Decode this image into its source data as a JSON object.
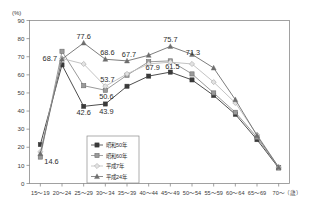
{
  "chart_data": {
    "type": "line",
    "title": "",
    "xlabel": "",
    "ylabel": "(%)",
    "x_unit": "（歳）",
    "ylim": [
      0,
      90
    ],
    "ytick_step": 10,
    "grid": false,
    "legend_position": "inside-bottom-center",
    "categories": [
      "15～19",
      "20～24",
      "25～29",
      "30～34",
      "35～39",
      "40～44",
      "45～49",
      "50～54",
      "55～59",
      "60～64",
      "65～69",
      "70～"
    ],
    "yticks": [
      "0",
      "10",
      "20",
      "30",
      "40",
      "50",
      "60",
      "70",
      "80",
      "90"
    ],
    "series": [
      {
        "name": "昭和50年",
        "marker": "filled-square",
        "color": "#3a3a3a",
        "values": [
          21.5,
          65.5,
          42.6,
          43.9,
          53.7,
          59.3,
          61.5,
          57.2,
          48.6,
          38.2,
          24.2,
          8.6
        ]
      },
      {
        "name": "昭和60年",
        "marker": "shaded-square",
        "color": "#8d8d8d",
        "values": [
          14.6,
          73.0,
          54.0,
          51.5,
          59.8,
          67.2,
          67.7,
          60.5,
          50.0,
          39.3,
          25.5,
          8.7
        ]
      },
      {
        "name": "平成7年",
        "marker": "light-diamond",
        "color": "#bcbcbc",
        "values": [
          17.5,
          69.0,
          66.0,
          53.7,
          60.5,
          66.0,
          67.0,
          66.0,
          56.0,
          44.5,
          27.0,
          9.0
        ]
      },
      {
        "name": "平成24年",
        "marker": "triangle",
        "color": "#6e6e6e",
        "values": [
          16.5,
          68.7,
          77.6,
          68.6,
          67.7,
          70.8,
          75.7,
          71.3,
          63.8,
          46.3,
          26.5,
          9.0
        ]
      }
    ],
    "annotations": [
      {
        "text": "14.6",
        "series": "昭和60年",
        "category": "15～19"
      },
      {
        "text": "68.7",
        "series": "平成24年",
        "category": "20～24"
      },
      {
        "text": "77.6",
        "series": "平成24年",
        "category": "25～29"
      },
      {
        "text": "42.6",
        "series": "昭和50年",
        "category": "25～29"
      },
      {
        "text": "43.9",
        "series": "昭和50年",
        "category": "30～34"
      },
      {
        "text": "53.7",
        "series": "平成7年",
        "category": "30～34"
      },
      {
        "text": "50.6",
        "series": "昭和60年",
        "category": "30～34"
      },
      {
        "text": "68.6",
        "series": "平成24年",
        "category": "30～34"
      },
      {
        "text": "67.7",
        "series": "平成24年",
        "category": "35～39"
      },
      {
        "text": "67.9",
        "series": "昭和60年",
        "category": "40～44"
      },
      {
        "text": "75.7",
        "series": "平成24年",
        "category": "45～49"
      },
      {
        "text": "61.5",
        "series": "昭和50年",
        "category": "45～49"
      },
      {
        "text": "71.3",
        "series": "平成24年",
        "category": "50～54"
      }
    ]
  },
  "labels": {
    "l_14_6": "14.6",
    "l_68_7": "68.7",
    "l_77_6": "77.6",
    "l_42_6": "42.6",
    "l_43_9": "43.9",
    "l_53_7": "53.7",
    "l_50_6": "50.6",
    "l_68_6": "68.6",
    "l_67_7": "67.7",
    "l_67_9": "67.9",
    "l_75_7": "75.7",
    "l_61_5": "61.5",
    "l_71_3": "71.3"
  },
  "yaxis": {
    "unit": "(%)",
    "ticks": [
      "90",
      "80",
      "70",
      "60",
      "50",
      "40",
      "30",
      "20",
      "10",
      "0"
    ]
  },
  "xaxis": {
    "unit": "（歳）",
    "ticks": [
      "15～19",
      "20～24",
      "25～29",
      "30～34",
      "35～39",
      "40～44",
      "45～49",
      "50～54",
      "55～59",
      "60～64",
      "65～69",
      "70～"
    ]
  },
  "legend": {
    "items": [
      {
        "label": "昭和50年"
      },
      {
        "label": "昭和60年"
      },
      {
        "label": "平成7年"
      },
      {
        "label": "平成24年"
      }
    ]
  }
}
